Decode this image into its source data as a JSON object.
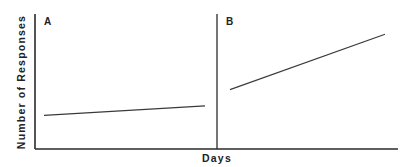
{
  "chart_data": {
    "type": "line",
    "title": "",
    "xlabel": "Days",
    "ylabel": "Number of Responses",
    "grid": false,
    "legend": null,
    "panels": [
      {
        "label": "A",
        "x": [
          0,
          1
        ],
        "values": [
          0.25,
          0.32
        ]
      },
      {
        "label": "B",
        "x": [
          0,
          1
        ],
        "values": [
          0.44,
          0.85
        ]
      }
    ],
    "ylim": [
      0,
      1
    ],
    "annotations": [
      "Phase change line between A and B"
    ]
  },
  "labels": {
    "panel_a": "A",
    "panel_b": "B",
    "xlabel": "Days",
    "ylabel": "Number of Responses"
  }
}
